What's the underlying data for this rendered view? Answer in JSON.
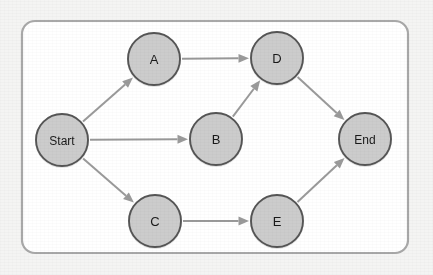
{
  "diagram": {
    "type": "directed-graph",
    "panel": {
      "x": 22,
      "y": 21,
      "width": 386,
      "height": 232,
      "corner_radius": 13,
      "fill": "#ffffff",
      "border_color": "#a8a8a8",
      "border_width": 2.2
    },
    "canvas": {
      "width": 433,
      "height": 275,
      "background": "#f4f4f3"
    },
    "style": {
      "node_fill": "#cccccc",
      "node_stroke": "#555555",
      "node_radius": 26,
      "edge_color": "#9a9a9a",
      "edge_width": 2.0,
      "arrow_color": "#9a9a9a",
      "label_color": "#1a1a1a"
    },
    "nodes": [
      {
        "id": "start",
        "label": "Start",
        "cx": 62,
        "cy": 140,
        "r": 26,
        "label_size": "small"
      },
      {
        "id": "a",
        "label": "A",
        "cx": 154,
        "cy": 59,
        "r": 26,
        "label_size": "normal"
      },
      {
        "id": "b",
        "label": "B",
        "cx": 216,
        "cy": 139,
        "r": 26,
        "label_size": "normal"
      },
      {
        "id": "c",
        "label": "C",
        "cx": 155,
        "cy": 221,
        "r": 26,
        "label_size": "normal"
      },
      {
        "id": "d",
        "label": "D",
        "cx": 277,
        "cy": 58,
        "r": 26,
        "label_size": "normal"
      },
      {
        "id": "e",
        "label": "E",
        "cx": 277,
        "cy": 221,
        "r": 26,
        "label_size": "normal"
      },
      {
        "id": "end",
        "label": "End",
        "cx": 365,
        "cy": 139,
        "r": 26,
        "label_size": "small"
      }
    ],
    "edges": [
      {
        "id": "start-a",
        "from": "start",
        "to": "a",
        "directed": true
      },
      {
        "id": "start-b",
        "from": "start",
        "to": "b",
        "directed": true
      },
      {
        "id": "start-c",
        "from": "start",
        "to": "c",
        "directed": true
      },
      {
        "id": "a-d",
        "from": "a",
        "to": "d",
        "directed": true
      },
      {
        "id": "b-d",
        "from": "b",
        "to": "d",
        "directed": true
      },
      {
        "id": "c-e",
        "from": "c",
        "to": "e",
        "directed": true
      },
      {
        "id": "d-end",
        "from": "d",
        "to": "end",
        "directed": true
      },
      {
        "id": "e-end",
        "from": "e",
        "to": "end",
        "directed": true
      }
    ]
  }
}
